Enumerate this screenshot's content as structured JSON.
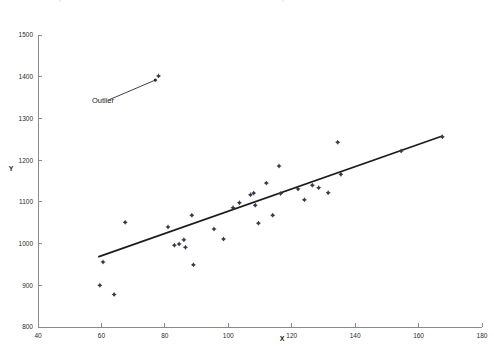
{
  "chart_data": {
    "type": "scatter",
    "title": "",
    "xlabel": "X",
    "ylabel": "Y",
    "xlim": [
      40,
      180
    ],
    "ylim": [
      800,
      1500
    ],
    "xticks": [
      40,
      60,
      80,
      100,
      120,
      140,
      160,
      180
    ],
    "yticks": [
      800,
      900,
      1000,
      1100,
      1200,
      1300,
      1400,
      1500
    ],
    "grid": false,
    "legend": false,
    "point_color": "#3a3a4a",
    "line_color": "#1c1c1c",
    "axis_color": "#8a8a8a",
    "points": [
      {
        "x": 59.5,
        "y": 900
      },
      {
        "x": 60.5,
        "y": 956
      },
      {
        "x": 64.0,
        "y": 878
      },
      {
        "x": 67.5,
        "y": 1051
      },
      {
        "x": 78.0,
        "y": 1402
      },
      {
        "x": 81.0,
        "y": 1040
      },
      {
        "x": 83.0,
        "y": 996
      },
      {
        "x": 84.5,
        "y": 999
      },
      {
        "x": 86.0,
        "y": 1009
      },
      {
        "x": 86.5,
        "y": 991
      },
      {
        "x": 88.5,
        "y": 1068
      },
      {
        "x": 89.0,
        "y": 949
      },
      {
        "x": 95.5,
        "y": 1035
      },
      {
        "x": 98.5,
        "y": 1011
      },
      {
        "x": 101.5,
        "y": 1086
      },
      {
        "x": 103.5,
        "y": 1098
      },
      {
        "x": 107.0,
        "y": 1117
      },
      {
        "x": 108.0,
        "y": 1121
      },
      {
        "x": 108.5,
        "y": 1092
      },
      {
        "x": 109.5,
        "y": 1049
      },
      {
        "x": 112.0,
        "y": 1145
      },
      {
        "x": 114.0,
        "y": 1068
      },
      {
        "x": 116.0,
        "y": 1186
      },
      {
        "x": 116.5,
        "y": 1120
      },
      {
        "x": 122.0,
        "y": 1131
      },
      {
        "x": 124.0,
        "y": 1105
      },
      {
        "x": 126.5,
        "y": 1140
      },
      {
        "x": 128.5,
        "y": 1134
      },
      {
        "x": 131.5,
        "y": 1122
      },
      {
        "x": 134.5,
        "y": 1243
      },
      {
        "x": 135.5,
        "y": 1166
      },
      {
        "x": 154.5,
        "y": 1222
      },
      {
        "x": 167.5,
        "y": 1256
      }
    ],
    "fit_line": {
      "x0": 59.0,
      "y0": 968,
      "x1": 167.5,
      "y1": 1258
    },
    "annotations": [
      {
        "text": "Outlier",
        "label_x": 57.0,
        "label_y": 1337,
        "arrow_from_x": 62.5,
        "arrow_from_y": 1345,
        "arrow_to_x": 77.0,
        "arrow_to_y": 1392
      }
    ]
  }
}
